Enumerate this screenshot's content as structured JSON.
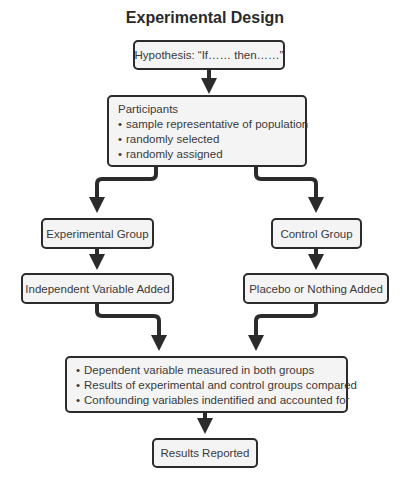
{
  "title": "Experimental Design",
  "nodes": {
    "hypothesis": {
      "label": "Hypothesis: “If…… then……”"
    },
    "participants": {
      "heading": "Participants",
      "items": [
        "sample representative of population",
        "randomly selected",
        "randomly assigned"
      ]
    },
    "experimental_group": {
      "label": "Experimental Group"
    },
    "control_group": {
      "label": "Control Group"
    },
    "independent_variable": {
      "label": "Independent Variable Added"
    },
    "placebo": {
      "label": "Placebo or Nothing Added"
    },
    "analysis": {
      "items": [
        "Dependent variable measured in both groups",
        "Results of experimental and control groups compared",
        "Confounding variables indentified and accounted for"
      ]
    },
    "results": {
      "label": "Results Reported"
    }
  },
  "edges": [
    {
      "from": "hypothesis",
      "to": "participants"
    },
    {
      "from": "participants",
      "to": "experimental_group"
    },
    {
      "from": "participants",
      "to": "control_group"
    },
    {
      "from": "experimental_group",
      "to": "independent_variable"
    },
    {
      "from": "control_group",
      "to": "placebo"
    },
    {
      "from": "independent_variable",
      "to": "analysis"
    },
    {
      "from": "placebo",
      "to": "analysis"
    },
    {
      "from": "analysis",
      "to": "results"
    }
  ],
  "colors": {
    "stroke": "#2b2b2b",
    "box_fill": "#f4f4f4",
    "text": "#3a3a3a"
  }
}
